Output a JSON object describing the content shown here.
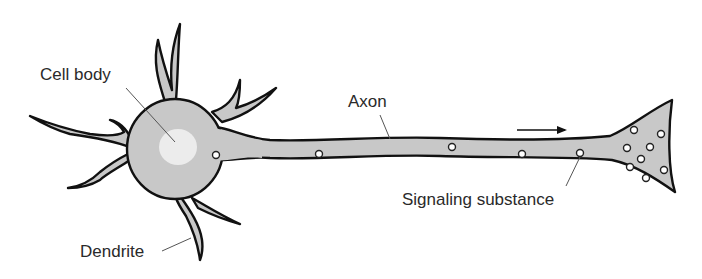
{
  "diagram": {
    "labels": {
      "cell_body": "Cell body",
      "axon": "Axon",
      "signaling_substance": "Signaling substance",
      "dendrite": "Dendrite"
    },
    "arrow": {
      "direction": "right",
      "meaning": "signal direction"
    },
    "colors": {
      "cell_fill": "#c8c8c8",
      "nucleus_fill": "#ececec",
      "outline": "#111111",
      "vesicle_fill": "#ffffff",
      "label_text": "#2a2a2a",
      "background": "#ffffff"
    },
    "parts": [
      "dendrites",
      "cell body",
      "nucleus",
      "axon",
      "axon terminal",
      "vesicles"
    ]
  }
}
